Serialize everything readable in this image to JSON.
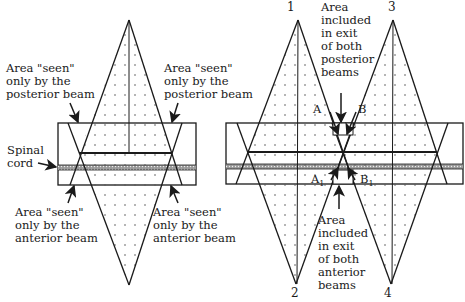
{
  "left_diagram": {
    "labels": {
      "posterior_left": [
        "Area \"seen\"",
        "only by the",
        "posterior beam"
      ],
      "posterior_right": [
        "Area \"seen\"",
        "only by the",
        "posterior beam"
      ],
      "spinal_cord": [
        "Spinal",
        "cord"
      ],
      "anterior_left": [
        "Area \"seen\"",
        "only by the",
        "anterior beam"
      ],
      "anterior_right": [
        "Area \"seen\"",
        "only by the",
        "anterior beam"
      ]
    }
  },
  "right_diagram": {
    "beam_numbers": [
      "1",
      "3",
      "2",
      "4"
    ],
    "points": {
      "A": "A",
      "B": "B",
      "A1": "A",
      "A1_sub": "1",
      "B1": "B",
      "B1_sub": "1"
    },
    "labels": {
      "posterior_overlap": [
        "Area",
        "included",
        "in exit",
        "of both",
        "posterior",
        "beams"
      ],
      "anterior_overlap": [
        "Area",
        "included",
        "in exit",
        "of both",
        "anterior",
        "beams"
      ]
    }
  },
  "colors": {
    "line": "#1a1a1a",
    "dots": "#555555",
    "cord": "#888888",
    "background": "#ffffff"
  }
}
